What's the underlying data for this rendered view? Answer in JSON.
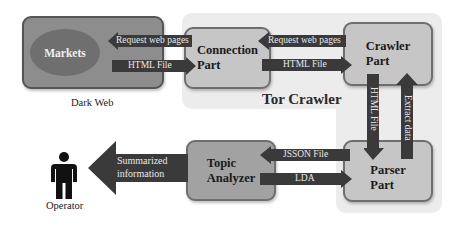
{
  "diagram": {
    "groups": {
      "dark_web": {
        "label": "Dark Web"
      },
      "tor_crawler": {
        "label": "Tor Crawler"
      }
    },
    "nodes": {
      "markets": {
        "label": "Markets"
      },
      "connection_part": {
        "line1": "Connection",
        "line2": "Part"
      },
      "crawler_part": {
        "line1": "Crawler",
        "line2": "Part"
      },
      "parser_part": {
        "line1": "Parser",
        "line2": "Part"
      },
      "topic_analyzer": {
        "line1": "Topic",
        "line2": "Analyzer"
      },
      "operator": {
        "label": "Operator"
      }
    },
    "edges": [
      {
        "from": "Connection Part",
        "to": "Markets",
        "label": "Request web pages"
      },
      {
        "from": "Markets",
        "to": "Connection Part",
        "label": "HTML File"
      },
      {
        "from": "Crawler Part",
        "to": "Connection Part",
        "label": "Request web pages"
      },
      {
        "from": "Connection Part",
        "to": "Crawler Part",
        "label": "HTML File"
      },
      {
        "from": "Crawler Part",
        "to": "Parser Part",
        "label": "HTML File"
      },
      {
        "from": "Parser Part",
        "to": "Crawler Part",
        "label": "Extract data"
      },
      {
        "from": "Parser Part",
        "to": "Topic Analyzer",
        "label": "JSSON File"
      },
      {
        "from": "Topic Analyzer",
        "to": "Parser Part",
        "label": "LDA"
      },
      {
        "from": "Topic Analyzer",
        "to": "Operator",
        "label_line1": "Summarized",
        "label_line2": "information"
      }
    ],
    "colors": {
      "arrow": "#3a3a3a",
      "box_light": "#c6c6c6",
      "box_mid": "#a2a2a2",
      "dark_web_box": "#8d8d8d",
      "markets_ellipse": "#6f6f6f",
      "tor_background": "#ececec"
    }
  }
}
